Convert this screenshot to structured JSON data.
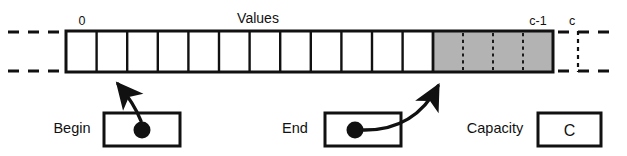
{
  "diagram": {
    "title": "Values",
    "index_labels": {
      "first": "0",
      "last_used": "c-1",
      "capacity_marker": "c"
    },
    "array": {
      "white_cell_count": 12,
      "gray_cell_count": 4,
      "gray_fill_color": "#b3b3b3",
      "border_color": "#111111",
      "cell_fill_color": "#ffffff"
    },
    "pointers": [
      {
        "name": "Begin",
        "label": "Begin",
        "value": "",
        "marker": "dot"
      },
      {
        "name": "End",
        "label": "End",
        "value": "",
        "marker": "dot"
      }
    ],
    "capacity": {
      "label": "Capacity",
      "value": "C"
    },
    "icons": {
      "begin_pointer_dot": "filled-circle-icon",
      "end_pointer_dot": "filled-circle-icon",
      "begin_arrow": "curved-arrow-icon",
      "end_arrow": "curved-arrow-icon",
      "left_continuation": "dashed-line-icon",
      "right_continuation": "dashed-line-icon"
    }
  }
}
